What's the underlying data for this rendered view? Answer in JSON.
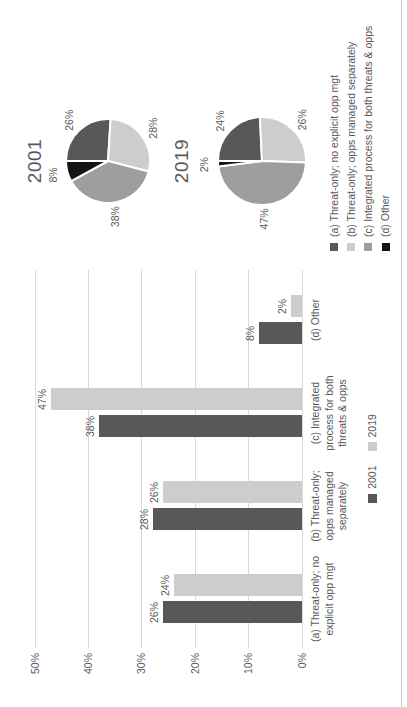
{
  "colors": {
    "background": "#ffffff",
    "text": "#595959",
    "gridline": "#d9d9d9",
    "border_line": "#c8c8c8",
    "series_dark": "#585858",
    "series_light": "#cdcdcd",
    "series_medium": "#9e9e9e",
    "series_black": "#141414"
  },
  "chart_data": [
    {
      "type": "bar",
      "title": "",
      "categories": [
        [
          "(a) Threat-only; no",
          "explicit opp mgt"
        ],
        [
          "(b) Threat-only;",
          "opps managed",
          "separately"
        ],
        [
          "(c) Integrated",
          "process for both",
          "threats & opps"
        ],
        [
          "(d) Other"
        ]
      ],
      "series": [
        {
          "name": "2001",
          "color": "#585858",
          "values": [
            26,
            28,
            38,
            8
          ],
          "data_labels": [
            "26%",
            "28%",
            "38%",
            "8%"
          ]
        },
        {
          "name": "2019",
          "color": "#cdcdcd",
          "values": [
            24,
            26,
            47,
            2
          ],
          "data_labels": [
            "24%",
            "26%",
            "47%",
            "2%"
          ]
        }
      ],
      "ylim": [
        0,
        50
      ],
      "ytick_step": 10,
      "yticks": [
        "0%",
        "10%",
        "20%",
        "30%",
        "40%",
        "50%"
      ],
      "grid": true,
      "legend_position": "bottom"
    },
    {
      "type": "pie",
      "title": "2001",
      "slices": [
        {
          "label": "26%",
          "value": 26,
          "color": "#585858"
        },
        {
          "label": "28%",
          "value": 28,
          "color": "#cdcdcd"
        },
        {
          "label": "38%",
          "value": 38,
          "color": "#9e9e9e"
        },
        {
          "label": "8%",
          "value": 8,
          "color": "#141414"
        }
      ]
    },
    {
      "type": "pie",
      "title": "2019",
      "slices": [
        {
          "label": "24%",
          "value": 24,
          "color": "#585858"
        },
        {
          "label": "26%",
          "value": 26,
          "color": "#cdcdcd"
        },
        {
          "label": "47%",
          "value": 47,
          "color": "#9e9e9e"
        },
        {
          "label": "2%",
          "value": 2,
          "color": "#141414"
        }
      ]
    }
  ],
  "legend": {
    "items": [
      {
        "label": "(a) Threat-only; no explicit opp mgt",
        "color": "#585858"
      },
      {
        "label": "(b) Threat-only; opps managed separately",
        "color": "#cdcdcd"
      },
      {
        "label": "(c) Integrated process for both threats & opps",
        "color": "#9e9e9e"
      },
      {
        "label": "(d) Other",
        "color": "#141414"
      }
    ]
  }
}
